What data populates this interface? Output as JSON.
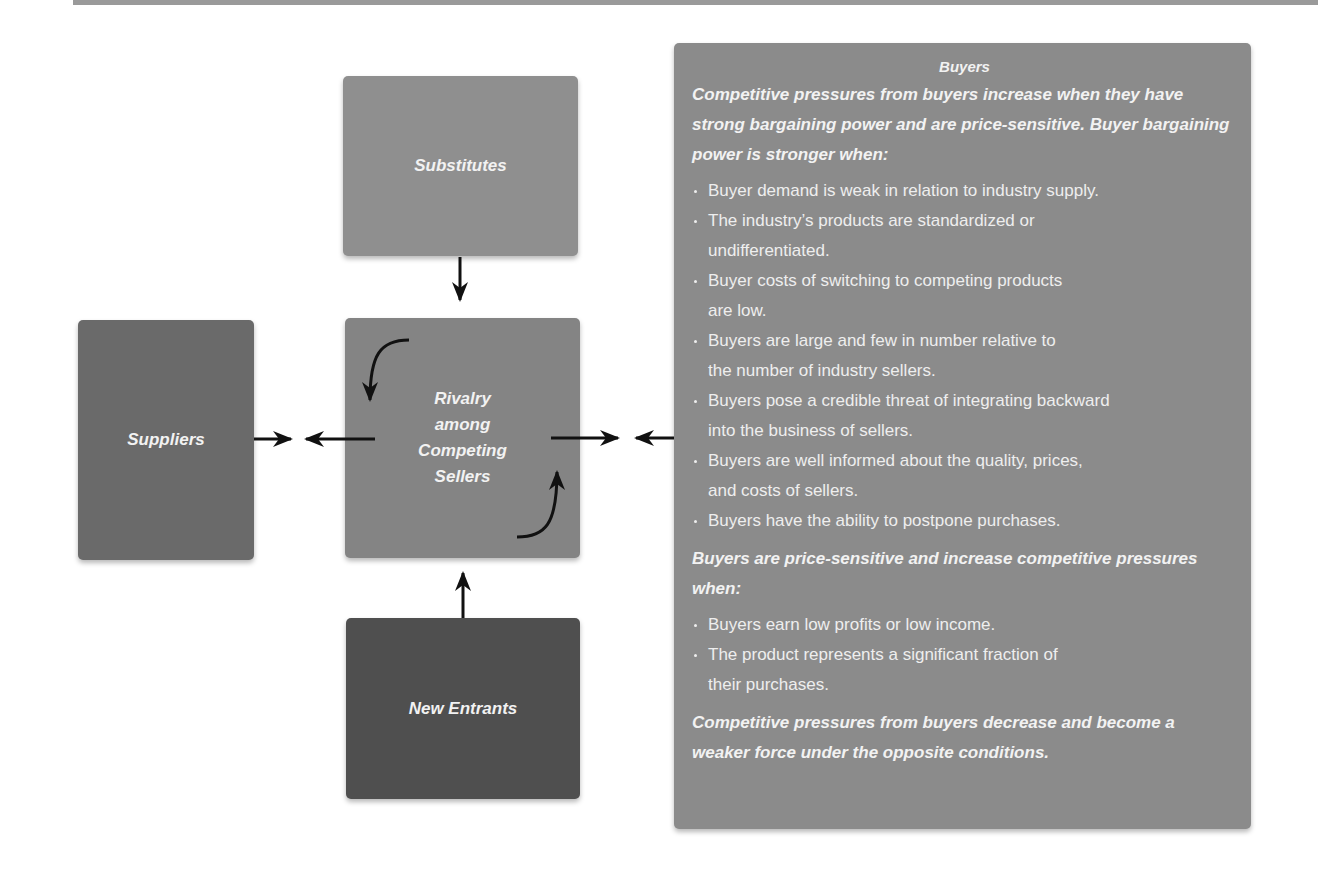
{
  "diagram": {
    "colors": {
      "suppliers": "#6a6a6a",
      "substitutes": "#8f8f8f",
      "rivalry": "#848484",
      "new_entrants": "#4f4f4f",
      "buyers": "#8b8b8b",
      "text": "#f2f2f2",
      "arrow": "#111111"
    },
    "boxes": {
      "suppliers": "Suppliers",
      "substitutes": "Substitutes",
      "rivalry": "Rivalry\namong\nCompeting\nSellers",
      "new_entrants": "New Entrants"
    },
    "buyers": {
      "title": "Buyers",
      "lead": "Competitive pressures from buyers increase when they have strong bargaining power and are price-sensitive. Buyer bargaining power is stronger when:",
      "bargaining_conditions": [
        "Buyer demand is weak in relation to industry supply.",
        "The industry’s products are standardized or\nundifferentiated.",
        "Buyer costs of switching to competing products\nare low.",
        "Buyers are large and few in number relative to\nthe number of industry sellers.",
        "Buyers pose a credible threat of integrating backward\ninto the business of sellers.",
        "Buyers are well informed about the quality, prices,\nand costs of sellers.",
        "Buyers have the ability to postpone purchases."
      ],
      "price_sensitive_lead": "Buyers are price-sensitive and increase competitive pressures when:",
      "price_sensitive_conditions": [
        "Buyers earn low profits or low income.",
        "The product represents a significant fraction of\ntheir purchases."
      ],
      "closing": "Competitive pressures from buyers decrease and become a weaker force under the opposite conditions."
    },
    "arrows": [
      {
        "from": "substitutes",
        "to": "rivalry",
        "direction": "down"
      },
      {
        "from": "new_entrants",
        "to": "rivalry",
        "direction": "up"
      },
      {
        "from": "suppliers",
        "to": "center-left",
        "direction": "right"
      },
      {
        "from": "rivalry",
        "to": "suppliers",
        "direction": "left"
      },
      {
        "from": "rivalry",
        "to": "buyers",
        "direction": "right"
      },
      {
        "from": "buyers",
        "to": "rivalry",
        "direction": "left"
      },
      {
        "from": "rivalry-top",
        "to": "rivalry-left",
        "direction": "curved-down"
      },
      {
        "from": "rivalry-bottom",
        "to": "rivalry-right",
        "direction": "curved-up"
      }
    ]
  }
}
